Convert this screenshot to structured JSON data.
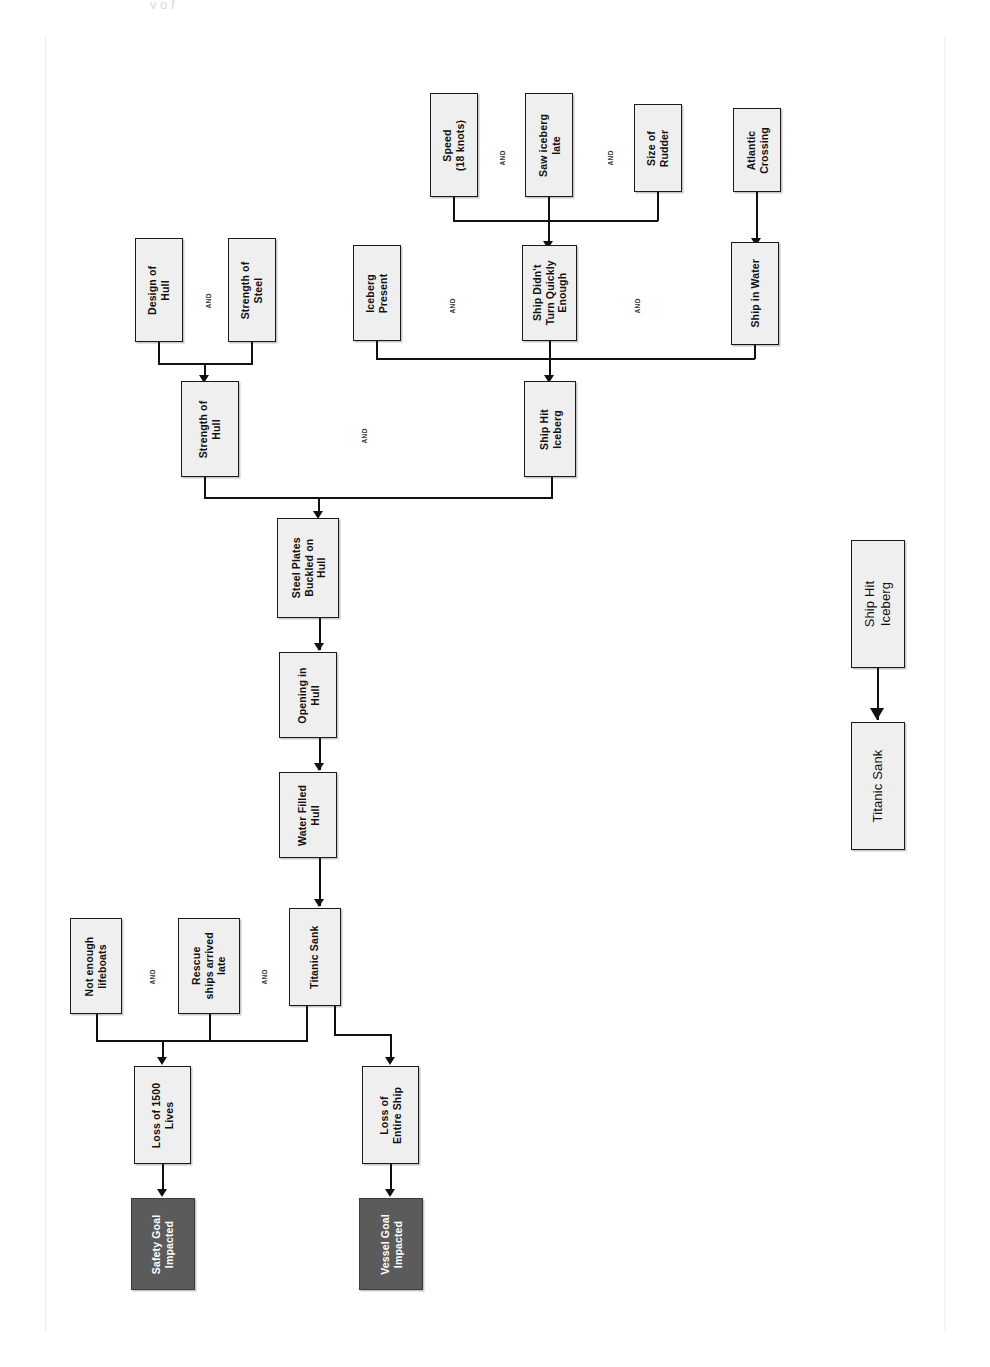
{
  "page": {
    "header_crop_text": "y   o   f",
    "orientation": "rotated-90-ccw",
    "background": "#ffffff",
    "rule_color": "#ececec"
  },
  "colors": {
    "node_fill": "#efefef",
    "node_border": "#1a1a1a",
    "goal_fill": "#5b5b5b",
    "goal_text": "#ffffff",
    "line": "#111111"
  },
  "diagram": {
    "nodes": [
      {
        "id": "speed",
        "label": "Speed\n(18 knots)"
      },
      {
        "id": "saw_late",
        "label": "Saw iceberg\nlate"
      },
      {
        "id": "rudder",
        "label": "Size of\nRudder"
      },
      {
        "id": "atlantic",
        "label": "Atlantic\nCrossing"
      },
      {
        "id": "design_hull",
        "label": "Design of\nHull"
      },
      {
        "id": "strength_steel",
        "label": "Strength of\nSteel"
      },
      {
        "id": "iceberg",
        "label": "Iceberg\nPresent"
      },
      {
        "id": "no_turn",
        "label": "Ship Didn't\nTurn Quickly\nEnough"
      },
      {
        "id": "ship_water",
        "label": "Ship in Water"
      },
      {
        "id": "strength_hull",
        "label": "Strength of\nHull"
      },
      {
        "id": "hit_iceberg",
        "label": "Ship Hit\nIceberg"
      },
      {
        "id": "buckled",
        "label": "Steel Plates\nBuckled on\nHull"
      },
      {
        "id": "opening",
        "label": "Opening in\nHull"
      },
      {
        "id": "water_filled",
        "label": "Water Filled\nHull"
      },
      {
        "id": "sank",
        "label": "Titanic Sank"
      },
      {
        "id": "lifeboats",
        "label": "Not enough\nlifeboats"
      },
      {
        "id": "rescue_late",
        "label": "Rescue\nships arrived\nlate"
      },
      {
        "id": "loss_lives",
        "label": "Loss of 1500\nLives"
      },
      {
        "id": "loss_ship",
        "label": "Loss of\nEntire Ship"
      },
      {
        "id": "safety_goal",
        "label": "Safety Goal\nImpacted"
      },
      {
        "id": "vessel_goal",
        "label": "Vessel Goal\nImpacted"
      }
    ],
    "gates": [
      {
        "id": "g1",
        "label": "AND"
      },
      {
        "id": "g2",
        "label": "AND"
      },
      {
        "id": "g3",
        "label": "AND"
      },
      {
        "id": "g4",
        "label": "AND"
      },
      {
        "id": "g5",
        "label": "AND"
      },
      {
        "id": "g6",
        "label": "AND"
      },
      {
        "id": "g7",
        "label": "AND"
      }
    ],
    "inset": {
      "nodes": [
        {
          "id": "inset_hit",
          "label": "Ship Hit\nIceberg"
        },
        {
          "id": "inset_sank",
          "label": "Titanic Sank"
        }
      ]
    }
  }
}
